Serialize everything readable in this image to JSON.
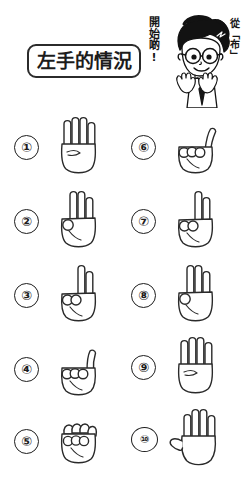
{
  "page": {
    "background_color": "#ffffff",
    "ink_color": "#1d1d1d",
    "width": 247,
    "height": 481
  },
  "header": {
    "title": "左手的情況",
    "title_box": {
      "border_color": "#2b2b2b",
      "fill_color": "#ffffff"
    },
    "annotation_start": "開始啲!",
    "annotation_from": "從「布」",
    "mascot": {
      "name": "cartoon-boy-with-glasses",
      "description": "spiky-black-hair boy wearing round glasses, shirt and necktie, both hands raised",
      "hair_color": "#101010",
      "skin_color": "#ffffff",
      "tie_color": "#111111"
    }
  },
  "legend": {
    "left_column_label": "①–⑤",
    "right_column_label": "⑥–⑩"
  },
  "rows": {
    "left": [
      {
        "number": "①",
        "index": 1,
        "gesture": "four-fingers-up",
        "fingers_up": 4,
        "thumb": "tucked",
        "hand_icon": "hand-four"
      },
      {
        "number": "②",
        "index": 2,
        "gesture": "three-fingers-up",
        "fingers_up": 3,
        "thumb": "tucked",
        "hand_icon": "hand-three"
      },
      {
        "number": "③",
        "index": 3,
        "gesture": "two-fingers-up",
        "fingers_up": 2,
        "thumb": "tucked",
        "hand_icon": "hand-two"
      },
      {
        "number": "④",
        "index": 4,
        "gesture": "one-finger-up",
        "fingers_up": 1,
        "thumb": "tucked",
        "hand_icon": "hand-one"
      },
      {
        "number": "⑤",
        "index": 5,
        "gesture": "closed-fist",
        "fingers_up": 0,
        "thumb": "tucked",
        "hand_icon": "hand-fist"
      }
    ],
    "right": [
      {
        "number": "⑥",
        "index": 6,
        "gesture": "thumb-up-only",
        "fingers_up": 1,
        "thumb": "extended",
        "hand_icon": "hand-thumb"
      },
      {
        "number": "⑦",
        "index": 7,
        "gesture": "two-fingers-up",
        "fingers_up": 2,
        "thumb": "tucked",
        "hand_icon": "hand-two"
      },
      {
        "number": "⑧",
        "index": 8,
        "gesture": "three-fingers-up",
        "fingers_up": 3,
        "thumb": "tucked",
        "hand_icon": "hand-three"
      },
      {
        "number": "⑨",
        "index": 9,
        "gesture": "four-fingers-up",
        "fingers_up": 4,
        "thumb": "tucked",
        "hand_icon": "hand-four"
      },
      {
        "number": "⑩",
        "index": 10,
        "gesture": "open-palm",
        "fingers_up": 5,
        "thumb": "extended",
        "hand_icon": "hand-open"
      }
    ]
  }
}
